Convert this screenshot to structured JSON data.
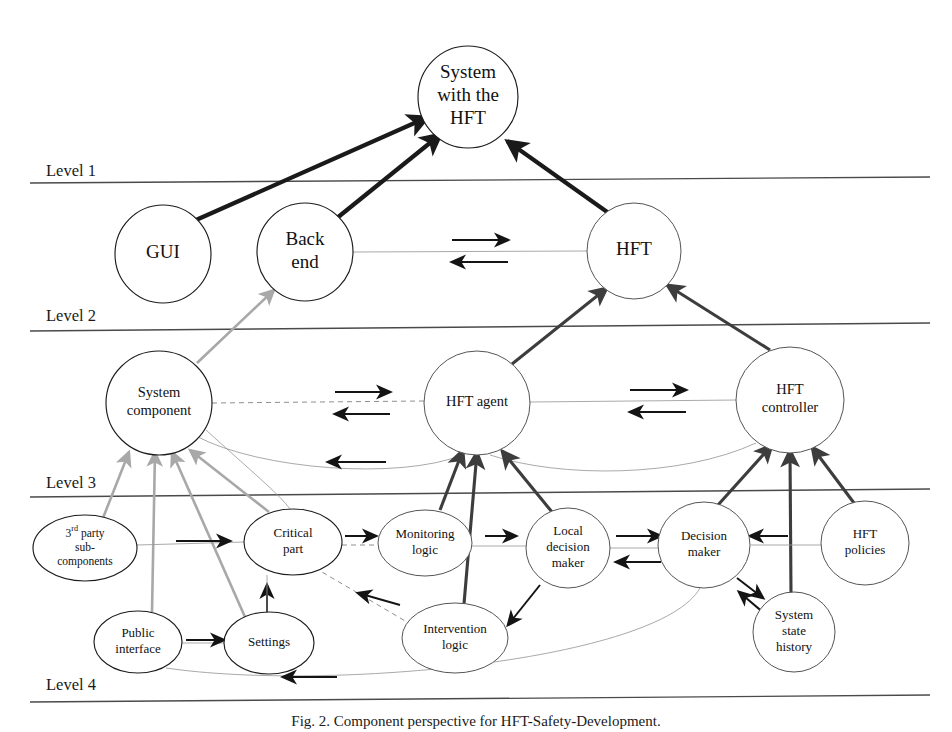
{
  "figure": {
    "caption": "Fig. 2. Component perspective for HFT-Safety-Development.",
    "background_color": "#ffffff",
    "width": 952,
    "height": 732
  },
  "levels": [
    {
      "id": "level-1",
      "label": "Level 1",
      "label_x": 46,
      "label_y": 176,
      "line_y_left": 183,
      "line_y_right": 177,
      "line_x1": 30,
      "line_x2": 930
    },
    {
      "id": "level-2",
      "label": "Level 2",
      "label_x": 46,
      "label_y": 321,
      "line_y_left": 331,
      "line_y_right": 323,
      "line_x1": 30,
      "line_x2": 930
    },
    {
      "id": "level-3",
      "label": "Level 3",
      "label_x": 46,
      "label_y": 488,
      "line_y_left": 497,
      "line_y_right": 489,
      "line_x1": 30,
      "line_x2": 930
    },
    {
      "id": "level-4",
      "label": "Level 4",
      "label_x": 46,
      "label_y": 690,
      "line_y_left": 702,
      "line_y_right": 695,
      "line_x1": 30,
      "line_x2": 930
    }
  ],
  "nodes": [
    {
      "id": "system-with-hft",
      "label_lines": [
        "System",
        "with the",
        "HFT"
      ],
      "cx": 468,
      "cy": 97,
      "rx": 50,
      "ry": 51,
      "font_size": 19,
      "line_height": 23,
      "stroke": "dark",
      "level": 1
    },
    {
      "id": "gui",
      "label_lines": [
        "GUI"
      ],
      "cx": 163,
      "cy": 254,
      "rx": 48,
      "ry": 49,
      "font_size": 19,
      "line_height": 23,
      "stroke": "dark",
      "level": 2
    },
    {
      "id": "back-end",
      "label_lines": [
        "Back",
        "end"
      ],
      "cx": 305,
      "cy": 252,
      "rx": 48,
      "ry": 49,
      "font_size": 19,
      "line_height": 23,
      "stroke": "dark",
      "level": 2
    },
    {
      "id": "hft",
      "label_lines": [
        "HFT"
      ],
      "cx": 634,
      "cy": 251,
      "rx": 47,
      "ry": 48,
      "font_size": 19,
      "line_height": 23,
      "stroke": "thin",
      "level": 2
    },
    {
      "id": "system-component",
      "label_lines": [
        "System",
        "component"
      ],
      "cx": 159,
      "cy": 403,
      "rx": 53,
      "ry": 52,
      "font_size": 14.5,
      "line_height": 18,
      "stroke": "dark",
      "level": 3
    },
    {
      "id": "hft-agent",
      "label_lines": [
        "HFT agent"
      ],
      "cx": 477,
      "cy": 403,
      "rx": 53,
      "ry": 52,
      "font_size": 14.5,
      "line_height": 18,
      "stroke": "thin",
      "level": 3
    },
    {
      "id": "hft-controller",
      "label_lines": [
        "HFT",
        "controller"
      ],
      "cx": 790,
      "cy": 400,
      "rx": 54,
      "ry": 53,
      "font_size": 14.5,
      "line_height": 18,
      "stroke": "thin",
      "level": 3
    },
    {
      "id": "third-party-subcomponents",
      "label_lines": [
        "3rd party",
        "sub-",
        "components"
      ],
      "cx": 85,
      "cy": 548,
      "rx": 52,
      "ry": 33,
      "font_size": 11.5,
      "line_height": 14,
      "stroke": "dark",
      "level": 4,
      "superscript": "rd"
    },
    {
      "id": "critical-part",
      "label_lines": [
        "Critical",
        "part"
      ],
      "cx": 293,
      "cy": 542,
      "rx": 49,
      "ry": 33,
      "font_size": 13,
      "line_height": 16,
      "stroke": "dark",
      "level": 4
    },
    {
      "id": "monitoring-logic",
      "label_lines": [
        "Monitoring",
        "logic"
      ],
      "cx": 425,
      "cy": 543,
      "rx": 47,
      "ry": 33,
      "font_size": 13,
      "line_height": 16,
      "stroke": "thin",
      "level": 4
    },
    {
      "id": "local-decision-maker",
      "label_lines": [
        "Local",
        "decision",
        "maker"
      ],
      "cx": 568,
      "cy": 548,
      "rx": 42,
      "ry": 40,
      "font_size": 13,
      "line_height": 16,
      "stroke": "thin",
      "level": 4
    },
    {
      "id": "decision-maker",
      "label_lines": [
        "Decision",
        "maker"
      ],
      "cx": 704,
      "cy": 545,
      "rx": 46,
      "ry": 43,
      "font_size": 13,
      "line_height": 16,
      "stroke": "thin",
      "level": 4
    },
    {
      "id": "hft-policies",
      "label_lines": [
        "HFT",
        "policies"
      ],
      "cx": 865,
      "cy": 543,
      "rx": 44,
      "ry": 42,
      "font_size": 13,
      "line_height": 16,
      "stroke": "thin",
      "level": 4
    },
    {
      "id": "public-interface",
      "label_lines": [
        "Public",
        "interface"
      ],
      "cx": 138,
      "cy": 642,
      "rx": 44,
      "ry": 31,
      "font_size": 13,
      "line_height": 16,
      "stroke": "dark",
      "level": 4
    },
    {
      "id": "settings",
      "label_lines": [
        "Settings"
      ],
      "cx": 269,
      "cy": 643,
      "rx": 45,
      "ry": 31,
      "font_size": 13,
      "line_height": 16,
      "stroke": "dark",
      "level": 4
    },
    {
      "id": "intervention-logic",
      "label_lines": [
        "Intervention",
        "logic"
      ],
      "cx": 455,
      "cy": 638,
      "rx": 53,
      "ry": 35,
      "font_size": 13,
      "line_height": 16,
      "stroke": "thin",
      "level": 4
    },
    {
      "id": "system-state-history",
      "label_lines": [
        "System",
        "state",
        "history"
      ],
      "cx": 794,
      "cy": 632,
      "rx": 41,
      "ry": 40,
      "font_size": 13,
      "line_height": 16,
      "stroke": "thin",
      "level": 4
    }
  ],
  "edges": [
    {
      "id": "gui-to-system",
      "from": "gui",
      "to": "system-with-hft",
      "style": "thick",
      "arrow": "end",
      "path": "M 196 220 L 428 117"
    },
    {
      "id": "backend-to-system",
      "from": "back-end",
      "to": "system-with-hft",
      "style": "thick",
      "arrow": "end",
      "path": "M 337 218 L 441 134"
    },
    {
      "id": "hft-to-system",
      "from": "hft",
      "to": "system-with-hft",
      "style": "thick",
      "arrow": "end",
      "path": "M 610 214 L 507 141"
    },
    {
      "id": "backend-hft-link",
      "from": "back-end",
      "to": "hft",
      "style": "hair",
      "arrow": "none",
      "path": "M 353 252 L 587 251"
    },
    {
      "id": "backend-to-hft-arrow",
      "from": "back-end",
      "to": "hft",
      "style": "small-arrow",
      "arrow": "end",
      "path": "M 452 240 L 508 240"
    },
    {
      "id": "hft-to-backend-arrow",
      "from": "hft",
      "to": "back-end",
      "style": "small-arrow",
      "arrow": "end",
      "path": "M 508 262 L 452 262"
    },
    {
      "id": "syscomp-to-backend",
      "from": "system-component",
      "to": "back-end",
      "style": "gray",
      "arrow": "end",
      "path": "M 197 363 L 274 290"
    },
    {
      "id": "hftagent-to-hft",
      "from": "hft-agent",
      "to": "hft",
      "style": "medium",
      "arrow": "end",
      "path": "M 512 364 L 607 288"
    },
    {
      "id": "hftctrl-to-hft",
      "from": "hft-controller",
      "to": "hft",
      "style": "medium",
      "arrow": "end",
      "path": "M 770 350 L 667 285"
    },
    {
      "id": "syscomp-hftagent-dashed",
      "from": "system-component",
      "to": "hft-agent",
      "style": "dashed",
      "arrow": "none",
      "path": "M 212 403 L 424 401"
    },
    {
      "id": "syscomp-to-agent-arrow",
      "from": "system-component",
      "to": "hft-agent",
      "style": "small-arrow",
      "arrow": "end",
      "path": "M 335 392 L 390 392"
    },
    {
      "id": "agent-to-syscomp-arrow",
      "from": "hft-agent",
      "to": "system-component",
      "style": "small-arrow",
      "arrow": "end",
      "path": "M 390 414 L 335 414"
    },
    {
      "id": "agent-hftctrl-link",
      "from": "hft-agent",
      "to": "hft-controller",
      "style": "hair",
      "arrow": "none",
      "path": "M 530 402 L 737 400"
    },
    {
      "id": "agent-to-ctrl-arrow",
      "from": "hft-agent",
      "to": "hft-controller",
      "style": "small-arrow",
      "arrow": "end",
      "path": "M 630 390 L 686 390"
    },
    {
      "id": "ctrl-to-agent-arrow",
      "from": "hft-controller",
      "to": "hft-agent",
      "style": "small-arrow",
      "arrow": "end",
      "path": "M 686 412 L 630 412"
    },
    {
      "id": "agent-to-syscomp-curve",
      "from": "hft-agent",
      "to": "system-component",
      "style": "hair",
      "arrow": "none",
      "path": "M 462 455 C 400 480 260 470 196 436"
    },
    {
      "id": "agent-curve-arrow",
      "from": "hft-agent",
      "to": "system-component",
      "style": "small-arrow",
      "arrow": "end",
      "path": "M 386 462 L 328 462"
    },
    {
      "id": "ctrl-to-agent-curve",
      "from": "hft-controller",
      "to": "hft-agent",
      "style": "hair",
      "arrow": "none",
      "path": "M 756 443 C 680 478 560 478 490 455"
    },
    {
      "id": "thirdparty-to-syscomp",
      "from": "third-party-subcomponents",
      "to": "system-component",
      "style": "gray",
      "arrow": "end",
      "path": "M 103 518 L 129 452"
    },
    {
      "id": "publicif-to-syscomp",
      "from": "public-interface",
      "to": "system-component",
      "style": "gray",
      "arrow": "end",
      "path": "M 152 612 L 155 452"
    },
    {
      "id": "settings-to-syscomp",
      "from": "settings",
      "to": "system-component",
      "style": "gray",
      "arrow": "end",
      "path": "M 245 617 L 172 452"
    },
    {
      "id": "criticalpart-to-syscomp",
      "from": "critical-part",
      "to": "system-component",
      "style": "gray",
      "arrow": "end",
      "path": "M 269 512 L 190 450"
    },
    {
      "id": "criticalpart-syscomp-hair",
      "from": "system-component",
      "to": "critical-part",
      "style": "hair",
      "arrow": "none",
      "path": "M 206 430 C 250 470 280 495 290 509"
    },
    {
      "id": "monitoring-to-agent",
      "from": "monitoring-logic",
      "to": "hft-agent",
      "style": "medium",
      "arrow": "end",
      "path": "M 440 510 L 463 450"
    },
    {
      "id": "intervention-to-agent",
      "from": "intervention-logic",
      "to": "hft-agent",
      "style": "medium",
      "arrow": "end",
      "path": "M 464 604 L 477 452"
    },
    {
      "id": "localdm-to-agent",
      "from": "local-decision-maker",
      "to": "hft-agent",
      "style": "medium",
      "arrow": "end",
      "path": "M 552 512 L 502 451"
    },
    {
      "id": "decisionmaker-to-ctrl",
      "from": "decision-maker",
      "to": "hft-controller",
      "style": "medium",
      "arrow": "end",
      "path": "M 718 505 L 772 445"
    },
    {
      "id": "statehistory-to-ctrl",
      "from": "system-state-history",
      "to": "hft-controller",
      "style": "medium",
      "arrow": "end",
      "path": "M 791 595 L 790 450"
    },
    {
      "id": "policies-to-ctrl",
      "from": "hft-policies",
      "to": "hft-controller",
      "style": "medium",
      "arrow": "end",
      "path": "M 854 503 L 812 447"
    },
    {
      "id": "thirdparty-criticalpart-hair",
      "from": "third-party-subcomponents",
      "to": "critical-part",
      "style": "hair",
      "arrow": "none",
      "path": "M 137 545 L 245 542"
    },
    {
      "id": "thirdparty-to-critical-arrow",
      "from": "third-party-subcomponents",
      "to": "critical-part",
      "style": "small-arrow",
      "arrow": "end",
      "path": "M 176 541 L 230 541"
    },
    {
      "id": "critical-monitoring-dash",
      "from": "critical-part",
      "to": "monitoring-logic",
      "style": "dashed",
      "arrow": "none",
      "path": "M 342 545 L 379 545"
    },
    {
      "id": "critical-to-monitoring-arrow",
      "from": "critical-part",
      "to": "monitoring-logic",
      "style": "small-arrow",
      "arrow": "end",
      "path": "M 345 536 L 376 536"
    },
    {
      "id": "monitoring-localdm-hair",
      "from": "monitoring-logic",
      "to": "local-decision-maker",
      "style": "hair",
      "arrow": "none",
      "path": "M 472 546 L 527 546"
    },
    {
      "id": "monitoring-to-localdm-arrow",
      "from": "monitoring-logic",
      "to": "local-decision-maker",
      "style": "small-arrow",
      "arrow": "end",
      "path": "M 485 536 L 516 536"
    },
    {
      "id": "localdm-decisionmaker-hair",
      "from": "local-decision-maker",
      "to": "decision-maker",
      "style": "hair",
      "arrow": "none",
      "path": "M 610 548 L 659 548"
    },
    {
      "id": "localdm-to-dm-arrow",
      "from": "local-decision-maker",
      "to": "decision-maker",
      "style": "small-arrow",
      "arrow": "end",
      "path": "M 616 536 L 661 536"
    },
    {
      "id": "dm-to-localdm-arrow",
      "from": "decision-maker",
      "to": "local-decision-maker",
      "style": "small-arrow",
      "arrow": "end",
      "path": "M 661 562 L 616 562"
    },
    {
      "id": "policies-dm-hair",
      "from": "hft-policies",
      "to": "decision-maker",
      "style": "hair",
      "arrow": "none",
      "path": "M 821 545 L 751 545"
    },
    {
      "id": "policies-to-dm-arrow",
      "from": "hft-policies",
      "to": "decision-maker",
      "style": "small-arrow",
      "arrow": "end",
      "path": "M 788 536 L 750 536"
    },
    {
      "id": "dm-to-statehistory-arrow",
      "from": "decision-maker",
      "to": "system-state-history",
      "style": "small-arrow",
      "arrow": "end",
      "path": "M 737 578 L 763 598"
    },
    {
      "id": "statehistory-to-dm-arrow",
      "from": "system-state-history",
      "to": "decision-maker",
      "style": "small-arrow",
      "arrow": "end",
      "path": "M 765 614 L 739 592"
    },
    {
      "id": "localdm-to-intervention",
      "from": "local-decision-maker",
      "to": "intervention-logic",
      "style": "small-arrow",
      "arrow": "end",
      "path": "M 540 585 L 508 625"
    },
    {
      "id": "intervention-to-critical-dash",
      "from": "intervention-logic",
      "to": "critical-part",
      "style": "dashed",
      "arrow": "none",
      "path": "M 412 625 L 322 572"
    },
    {
      "id": "intervention-to-critical-arrow",
      "from": "intervention-logic",
      "to": "critical-part",
      "style": "small-arrow",
      "arrow": "end",
      "path": "M 400 605 L 358 593"
    },
    {
      "id": "settings-to-criticalpart-arrow",
      "from": "settings",
      "to": "critical-part",
      "style": "small-arrow",
      "arrow": "end",
      "path": "M 267 613 L 267 585"
    },
    {
      "id": "settings-criticalpart-hair",
      "from": "settings",
      "to": "critical-part",
      "style": "hair",
      "arrow": "none",
      "path": "M 267 618 L 267 575"
    },
    {
      "id": "publicif-settings-hair",
      "from": "public-interface",
      "to": "settings",
      "style": "hair",
      "arrow": "none",
      "path": "M 182 643 L 225 643"
    },
    {
      "id": "publicif-to-settings-arrow",
      "from": "public-interface",
      "to": "settings",
      "style": "small-arrow",
      "arrow": "end",
      "path": "M 186 640 L 224 640"
    },
    {
      "id": "decisionmaker-to-publicif-curve",
      "from": "decision-maker",
      "to": "public-interface",
      "style": "hair",
      "arrow": "none",
      "path": "M 700 588 C 660 660 330 692 166 668"
    },
    {
      "id": "dm-publicif-curve-arrow",
      "from": "decision-maker",
      "to": "public-interface",
      "style": "small-arrow",
      "arrow": "end",
      "path": "M 337 677 L 283 677"
    }
  ],
  "colors": {
    "stroke_dark": "#1a1a1a",
    "stroke_medium": "#3d3d3d",
    "stroke_gray": "#a8a8a8",
    "stroke_hair": "#9a9a9a",
    "background": "#ffffff"
  }
}
